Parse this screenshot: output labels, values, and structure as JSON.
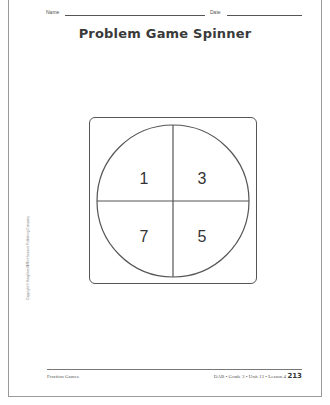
{
  "header": {
    "name_label": "Name",
    "date_label": "Date"
  },
  "title": "Problem Game Spinner",
  "spinner": {
    "sections": [
      {
        "position": "top-left",
        "value": "1"
      },
      {
        "position": "top-right",
        "value": "3"
      },
      {
        "position": "bottom-left",
        "value": "7"
      },
      {
        "position": "bottom-right",
        "value": "5"
      }
    ]
  },
  "sidebar": {
    "copyright": "Copyright © Houghton Mifflin Harcourt Publishing Company"
  },
  "footer": {
    "left": "Fraction Games",
    "right": "DAB • Grade 3 • Unit 13 • Lesson 4",
    "page_number": "213"
  }
}
